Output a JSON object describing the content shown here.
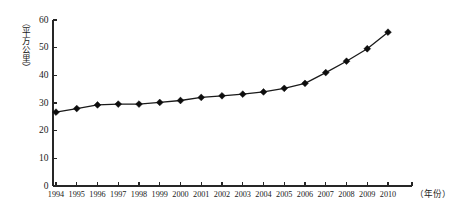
{
  "chart_data": {
    "type": "line",
    "title": "",
    "xlabel": "（年份）",
    "ylabel": "（平方公里）",
    "categories": [
      "1994",
      "1995",
      "1996",
      "1997",
      "1998",
      "1999",
      "2000",
      "2001",
      "2002",
      "2003",
      "2004",
      "2005",
      "2006",
      "2007",
      "2008",
      "2009",
      "2010"
    ],
    "values": [
      26.7,
      28.0,
      29.3,
      29.6,
      29.6,
      30.2,
      30.9,
      32.0,
      32.6,
      33.2,
      34.0,
      35.3,
      37.1,
      41.0,
      45.1,
      49.6,
      55.6
    ],
    "x": [
      1994,
      1995,
      1996,
      1997,
      1998,
      1999,
      2000,
      2001,
      2002,
      2003,
      2004,
      2005,
      2006,
      2007,
      2008,
      2009,
      2010
    ],
    "ylim": [
      0,
      60
    ],
    "yticks": [
      0,
      10,
      20,
      30,
      40,
      50,
      60
    ],
    "ytick_labels": [
      "0",
      "10",
      "20",
      "30",
      "40",
      "50",
      "60"
    ],
    "xtick_labels": [
      "1994",
      "1995",
      "1996",
      "1997",
      "1998",
      "1999",
      "2000",
      "2001",
      "2002",
      "2003",
      "2004",
      "2005",
      "2006",
      "2007",
      "2008",
      "2009",
      "2010"
    ],
    "grid": false,
    "legend": null,
    "legend_position": "none",
    "series_name": "",
    "marker": "diamond",
    "line_color": "#1a1a1a",
    "marker_color": "#0d0d0d",
    "axis_color": "#262626",
    "background_color": "#ffffff"
  }
}
